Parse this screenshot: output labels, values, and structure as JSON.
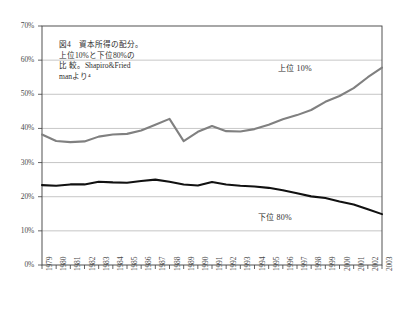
{
  "chart_data": {
    "type": "line",
    "title": "",
    "xlabel": "",
    "ylabel": "",
    "ylim": [
      0,
      70
    ],
    "ytick_labels": [
      "0%",
      "10%",
      "20%",
      "30%",
      "40%",
      "50%",
      "60%",
      "70%"
    ],
    "ytick_values": [
      0,
      10,
      20,
      30,
      40,
      50,
      60,
      70
    ],
    "grid": "horizontal",
    "legend_position": "inline-annotations",
    "categories": [
      "1979",
      "1980",
      "1981",
      "1982",
      "1983",
      "1984",
      "1985",
      "1986",
      "1987",
      "1988",
      "1989",
      "1990",
      "1991",
      "1992",
      "1993",
      "1994",
      "1995",
      "1996",
      "1997",
      "1998",
      "1999",
      "2000",
      "2001",
      "2002",
      "2003"
    ],
    "series": [
      {
        "name": "上位 10%",
        "color": "#808080",
        "values": [
          38.2,
          36.3,
          36.0,
          36.2,
          37.6,
          38.2,
          38.4,
          39.4,
          41.1,
          42.8,
          36.3,
          39.0,
          40.7,
          39.2,
          39.1,
          39.8,
          41.1,
          42.7,
          43.9,
          45.4,
          47.8,
          49.5,
          51.8,
          55.0,
          57.8
        ]
      },
      {
        "name": "下位 80%",
        "color": "#111111",
        "values": [
          23.4,
          23.2,
          23.6,
          23.6,
          24.4,
          24.2,
          24.1,
          24.6,
          25.0,
          24.4,
          23.6,
          23.3,
          24.3,
          23.6,
          23.2,
          23.0,
          22.6,
          21.9,
          21.0,
          20.1,
          19.6,
          18.6,
          17.7,
          16.3,
          14.9
        ]
      }
    ],
    "annotation": "図4　資本所得の配分。\n上位10%と下位80%の\n比 較。Shapiro&Fried\nmanより⁴",
    "series_label_top": "上位 10%",
    "series_label_bottom": "下位 80%"
  },
  "colors": {
    "frame": "#3f3f3f",
    "gridline": "#b8b8b8",
    "upper_series": "#808080",
    "lower_series": "#111111",
    "tick_text": "#4a4a4a",
    "background": "#ffffff"
  }
}
